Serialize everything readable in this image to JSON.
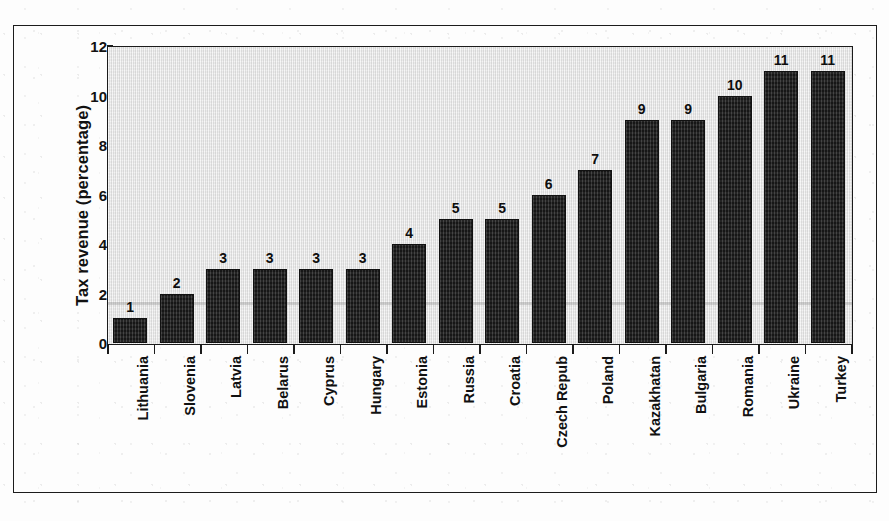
{
  "chart_data": {
    "type": "bar",
    "title": "",
    "xlabel": "",
    "ylabel": "Tax revenue (percentage)",
    "ylim": [
      0,
      12
    ],
    "yticks": [
      0,
      2,
      4,
      6,
      8,
      10,
      12
    ],
    "grid": false,
    "legend": false,
    "categories": [
      "Lithuania",
      "Slovenia",
      "Latvia",
      "Belarus",
      "Cyprus",
      "Hungary",
      "Estonia",
      "Russia",
      "Croatia",
      "Czech Repub",
      "Poland",
      "Kazakhatan",
      "Bulgaria",
      "Romania",
      "Ukraine",
      "Turkey"
    ],
    "values": [
      1,
      2,
      3,
      3,
      3,
      3,
      4,
      5,
      5,
      6,
      7,
      9,
      9,
      10,
      11,
      11
    ],
    "data_labels": [
      "1",
      "2",
      "3",
      "3",
      "3",
      "3",
      "4",
      "5",
      "5",
      "6",
      "7",
      "9",
      "9",
      "10",
      "11",
      "11"
    ],
    "ytick_labels": [
      "0",
      "2",
      "4",
      "6",
      "8",
      "10",
      "12"
    ],
    "colors": {
      "bar_fill": "#232323",
      "bar_border": "#111111",
      "plot_background": "#e9e9e9",
      "axis": "#1b1b1b",
      "text": "#111111",
      "page_background": "#fdfdfd",
      "frame": "#1c1c1c"
    }
  }
}
